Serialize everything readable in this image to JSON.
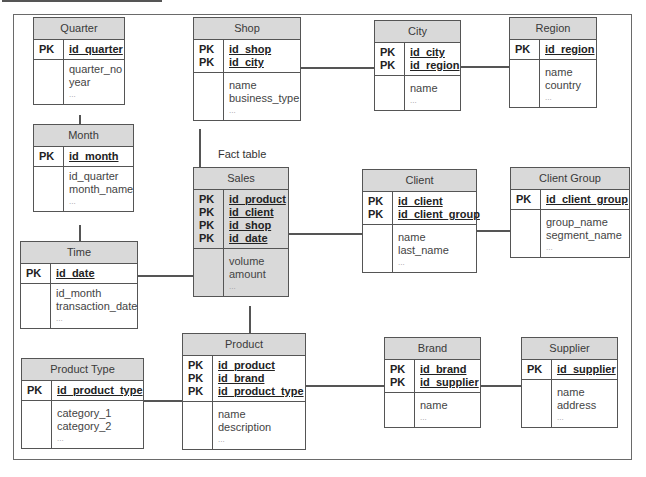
{
  "diagram": {
    "fact_label": "Fact table",
    "tables": {
      "quarter": {
        "name": "Quarter",
        "pk": [
          "id_quarter"
        ],
        "attrs": [
          "quarter_no",
          "year"
        ],
        "more": "..."
      },
      "month": {
        "name": "Month",
        "pk": [
          "id_month"
        ],
        "attrs": [
          "id_quarter",
          "month_name"
        ],
        "more": "..."
      },
      "time": {
        "name": "Time",
        "pk": [
          "id_date"
        ],
        "attrs": [
          "id_month",
          "transaction_date"
        ],
        "more": "..."
      },
      "shop": {
        "name": "Shop",
        "pk": [
          "id_shop",
          "id_city"
        ],
        "attrs": [
          "name",
          "business_type"
        ],
        "more": "..."
      },
      "city": {
        "name": "City",
        "pk": [
          "id_city",
          "id_region"
        ],
        "attrs": [
          "name"
        ],
        "more": "..."
      },
      "region": {
        "name": "Region",
        "pk": [
          "id_region"
        ],
        "attrs": [
          "name",
          "country"
        ],
        "more": "..."
      },
      "sales": {
        "name": "Sales",
        "pk": [
          "id_product",
          "id_client",
          "id_shop",
          "id_date"
        ],
        "attrs": [
          "volume",
          "amount"
        ],
        "more": "..."
      },
      "client": {
        "name": "Client",
        "pk": [
          "id_client",
          "id_client_group"
        ],
        "attrs": [
          "name",
          "last_name"
        ],
        "more": "..."
      },
      "client_group": {
        "name": "Client Group",
        "pk": [
          "id_client_group"
        ],
        "attrs": [
          "group_name",
          "segment_name"
        ],
        "more": "..."
      },
      "product_type": {
        "name": "Product Type",
        "pk": [
          "id_product_type"
        ],
        "attrs": [
          "category_1",
          "category_2"
        ],
        "more": "..."
      },
      "product": {
        "name": "Product",
        "pk": [
          "id_product",
          "id_brand",
          "id_product_type"
        ],
        "attrs": [
          "name",
          "description"
        ],
        "more": "..."
      },
      "brand": {
        "name": "Brand",
        "pk": [
          "id_brand",
          "id_supplier"
        ],
        "attrs": [
          "name"
        ],
        "more": "..."
      },
      "supplier": {
        "name": "Supplier",
        "pk": [
          "id_supplier"
        ],
        "attrs": [
          "name",
          "address"
        ],
        "more": "..."
      }
    },
    "pk_label": "PK",
    "relationships": [
      [
        "quarter",
        "month"
      ],
      [
        "month",
        "time"
      ],
      [
        "time",
        "sales"
      ],
      [
        "shop",
        "sales"
      ],
      [
        "shop",
        "city"
      ],
      [
        "city",
        "region"
      ],
      [
        "sales",
        "client"
      ],
      [
        "client",
        "client_group"
      ],
      [
        "sales",
        "product"
      ],
      [
        "product_type",
        "product"
      ],
      [
        "product",
        "brand"
      ],
      [
        "brand",
        "supplier"
      ]
    ],
    "colors": {
      "header": "#d9d9d9",
      "border": "#555555",
      "fact_fill": "#d9d9d9"
    }
  }
}
